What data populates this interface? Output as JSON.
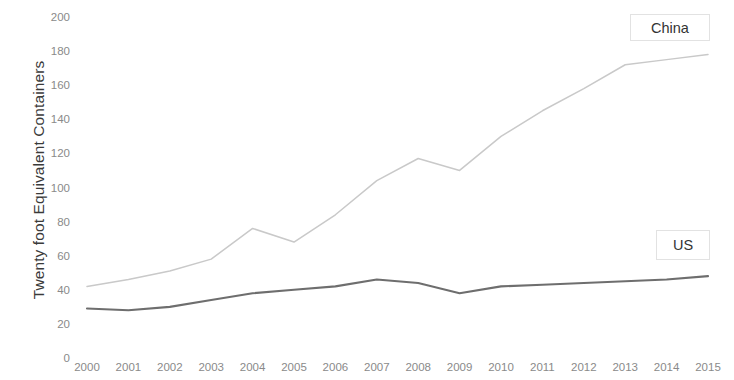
{
  "chart_data": {
    "type": "line",
    "title": "",
    "xlabel": "",
    "ylabel": "Twenty foot Equivalent Containers",
    "categories": [
      "2000",
      "2001",
      "2002",
      "2003",
      "2004",
      "2005",
      "2006",
      "2007",
      "2008",
      "2009",
      "2010",
      "2011",
      "2012",
      "2013",
      "2014",
      "2015"
    ],
    "x": [
      2000,
      2001,
      2002,
      2003,
      2004,
      2005,
      2006,
      2007,
      2008,
      2009,
      2010,
      2011,
      2012,
      2013,
      2014,
      2015
    ],
    "series": [
      {
        "name": "China",
        "color": "#c9c9c9",
        "values": [
          42,
          46,
          51,
          58,
          76,
          68,
          84,
          104,
          117,
          110,
          130,
          145,
          158,
          172,
          175,
          178
        ]
      },
      {
        "name": "US",
        "color": "#6e6e6e",
        "values": [
          29,
          28,
          30,
          34,
          38,
          40,
          42,
          46,
          44,
          38,
          42,
          43,
          44,
          45,
          46,
          48
        ]
      }
    ],
    "ylim": [
      0,
      200
    ],
    "yticks": [
      0,
      20,
      40,
      60,
      80,
      100,
      120,
      140,
      160,
      180,
      200
    ],
    "ytick_labels": [
      "0",
      "20",
      "40",
      "60",
      "80",
      "100",
      "120",
      "140",
      "160",
      "180",
      "200"
    ],
    "xlim": [
      2000,
      2015
    ],
    "grid": false,
    "legend_position": "inline-right",
    "annotations": [
      {
        "text": "China",
        "series": "China"
      },
      {
        "text": "US",
        "series": "US"
      }
    ]
  },
  "axis": {
    "y_title": "Twenty foot Equivalent Containers"
  },
  "labels": {
    "china": "China",
    "us": "US"
  }
}
